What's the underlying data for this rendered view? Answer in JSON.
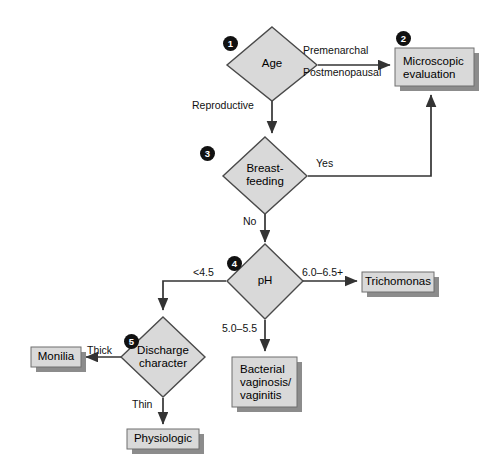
{
  "diagram": {
    "colors": {
      "node_fill": "#d9d9d9",
      "node_stroke": "#3a3a3a",
      "shadow": "#8c8c8c",
      "line": "#333333",
      "badge_bg": "#111111",
      "badge_text": "#ffffff",
      "background": "#ffffff"
    },
    "nodes": [
      {
        "id": "age",
        "type": "decision",
        "label": "Age",
        "step": "1"
      },
      {
        "id": "microscopic",
        "type": "terminal",
        "label_line1": "Microscopic",
        "label_line2": "evaluation",
        "step": "2"
      },
      {
        "id": "breastfeeding",
        "type": "decision",
        "label_line1": "Breast-",
        "label_line2": "feeding",
        "step": "3"
      },
      {
        "id": "ph",
        "type": "decision",
        "label": "pH",
        "step": "4"
      },
      {
        "id": "trichomonas",
        "type": "terminal",
        "label": "Trichomonas"
      },
      {
        "id": "discharge",
        "type": "decision",
        "label_line1": "Discharge",
        "label_line2": "character",
        "step": "5"
      },
      {
        "id": "bacterial",
        "type": "terminal",
        "label_line1": "Bacterial",
        "label_line2": "vaginosis/",
        "label_line3": "vaginitis"
      },
      {
        "id": "monilia",
        "type": "terminal",
        "label": "Monilia"
      },
      {
        "id": "physiologic",
        "type": "terminal",
        "label": "Physiologic"
      }
    ],
    "edges": [
      {
        "id": "age-to-microscopic",
        "from": "age",
        "to": "microscopic",
        "label_line1": "Premenarchal",
        "label_line2": "Postmenopausal"
      },
      {
        "id": "age-to-breastfeeding",
        "from": "age",
        "to": "breastfeeding",
        "label": "Reproductive"
      },
      {
        "id": "breastfeeding-to-microscopic",
        "from": "breastfeeding",
        "to": "microscopic",
        "label": "Yes"
      },
      {
        "id": "breastfeeding-to-ph",
        "from": "breastfeeding",
        "to": "ph",
        "label": "No"
      },
      {
        "id": "ph-to-discharge",
        "from": "ph",
        "to": "discharge",
        "label": "<4.5"
      },
      {
        "id": "ph-to-trichomonas",
        "from": "ph",
        "to": "trichomonas",
        "label": "6.0–6.5+"
      },
      {
        "id": "ph-to-bacterial",
        "from": "ph",
        "to": "bacterial",
        "label": "5.0–5.5"
      },
      {
        "id": "discharge-to-monilia",
        "from": "discharge",
        "to": "monilia",
        "label": "Thick"
      },
      {
        "id": "discharge-to-physiologic",
        "from": "discharge",
        "to": "physiologic",
        "label": "Thin"
      }
    ]
  }
}
